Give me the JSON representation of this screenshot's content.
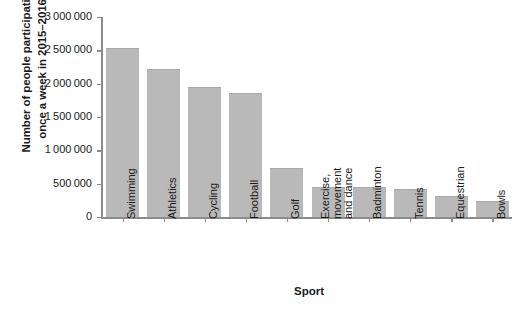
{
  "chart_data": {
    "type": "bar",
    "title": "",
    "xlabel": "Sport",
    "ylabel": "Number of people participating once a week in 2015–2016",
    "ylabel_lines": [
      "Number of people participating",
      "once a week in 2015–2016"
    ],
    "categories": [
      "Swimming",
      "Athletics",
      "Cycling",
      "Football",
      "Golf",
      "Exercise, movement and dance",
      "Badminton",
      "Tennis",
      "Equestrian",
      "Bowls"
    ],
    "category_label_lines": [
      [
        "Swimming"
      ],
      [
        "Athletics"
      ],
      [
        "Cycling"
      ],
      [
        "Football"
      ],
      [
        "Golf"
      ],
      [
        "Exercise,",
        "movement",
        "and dance"
      ],
      [
        "Badminton"
      ],
      [
        "Tennis"
      ],
      [
        "Equestrian"
      ],
      [
        "Bowls"
      ]
    ],
    "values": [
      2530000,
      2215000,
      1955000,
      1860000,
      740000,
      455000,
      445000,
      425000,
      320000,
      245000
    ],
    "ylim": [
      0,
      3000000
    ],
    "ytick_values": [
      3000000,
      2500000,
      2000000,
      1500000,
      1000000,
      500000,
      0
    ],
    "ytick_labels": [
      "3 000 000",
      "2 500 000",
      "2 000 000",
      "1 500 000",
      "1 000 000",
      "500 000",
      "0"
    ],
    "grid": false,
    "legend": null,
    "bar_color": "#b9b9b9",
    "axis_color": "#8c8c8c",
    "background_color": "#ffffff"
  }
}
